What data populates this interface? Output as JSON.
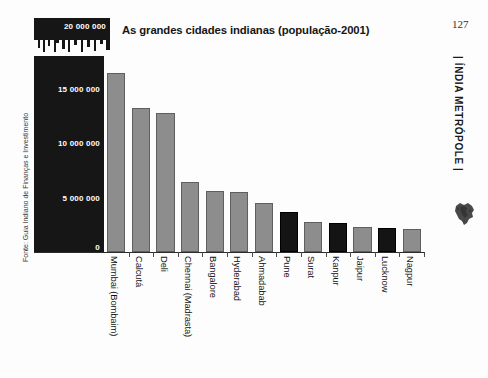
{
  "folio": "127",
  "running_head": "|  ÍNDIA METRÓPOLE  |",
  "scale_box": {
    "label": "20 000 000",
    "icon": "city-skyline-icon"
  },
  "source_note": "Fonte: Guia Indiano de Finanças e Investimento",
  "decorations": {
    "india_map": "india-map-icon"
  },
  "chart_data": {
    "type": "bar",
    "title": "As grandes cidades indianas (população-2001)",
    "xlabel": "",
    "ylabel": "",
    "ylim": [
      0,
      18000000
    ],
    "grid": false,
    "legend": false,
    "ytick_labels": [
      "0",
      "5 000 000",
      "10 000 000",
      "15 000 000"
    ],
    "ytick_values": [
      0,
      5000000,
      10000000,
      15000000
    ],
    "categories": [
      "Mumbai (Bombaim)",
      "Calcutá",
      "Deli",
      "Chennai (Madrasta)",
      "Bangalore",
      "Hyderabad",
      "Ahmadabab",
      "Pune",
      "Surat",
      "Kanpur",
      "Jaipur",
      "Lucknow",
      "Nagpur"
    ],
    "values": [
      16400000,
      13200000,
      12800000,
      6400000,
      5600000,
      5500000,
      4500000,
      3700000,
      2800000,
      2700000,
      2300000,
      2250000,
      2100000
    ],
    "bar_colors": [
      "#8d8d8d",
      "#8d8d8d",
      "#8d8d8d",
      "#8d8d8d",
      "#8d8d8d",
      "#8d8d8d",
      "#8d8d8d",
      "#141414",
      "#8d8d8d",
      "#141414",
      "#8d8d8d",
      "#141414",
      "#8d8d8d"
    ]
  },
  "colors": {
    "panel_background": "#161616",
    "bar_gray": "#8d8d8d",
    "bar_black": "#141414",
    "page_background": "#fdfdfd",
    "text": "#121212"
  }
}
